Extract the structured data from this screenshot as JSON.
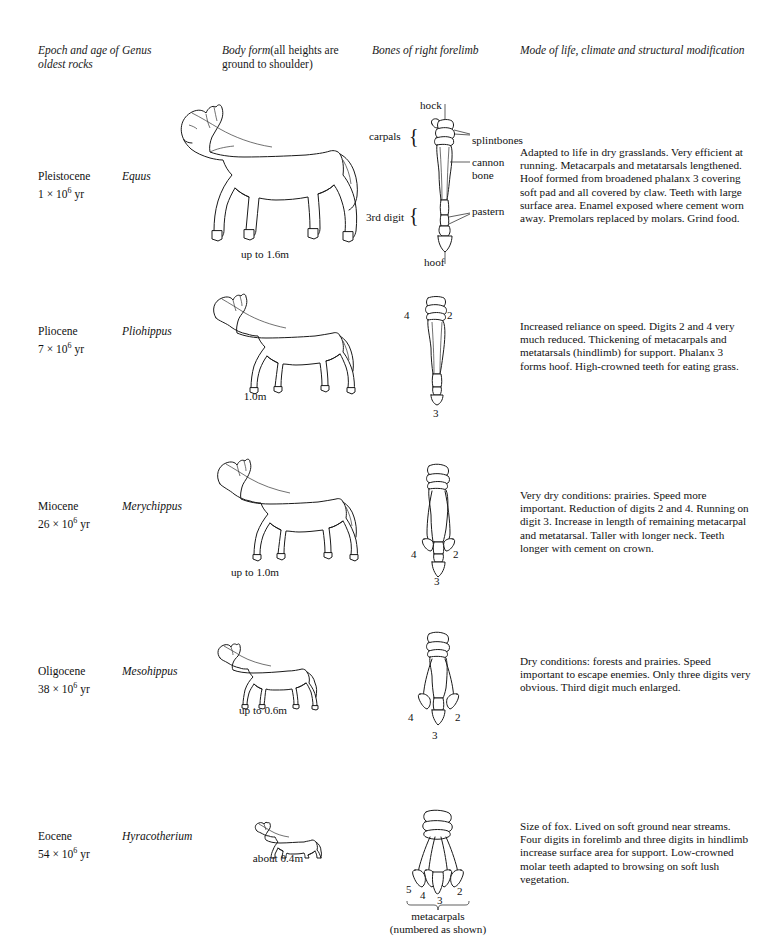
{
  "headers": {
    "epoch": "Epoch and age of oldest rocks",
    "genus": "Genus",
    "body_form_italic": "Body form",
    "body_form_rest": "(all heights are ground to shoulder)",
    "bones": "Bones of right forelimb",
    "mode": "Mode of life, climate and structural modification"
  },
  "rows": [
    {
      "epoch": "Pleistocene",
      "age_value": "1 × 10",
      "age_exp": "6",
      "age_unit": " yr",
      "genus": "Equus",
      "size_caption": "up to 1.6m",
      "description": "Adapted to life in dry grasslands. Very efficient at running. Metacarpals and metatarsals lengthened. Hoof formed from broadened phalanx 3 covering soft pad and all covered by claw. Teeth with large surface area. Enamel exposed where cement worn away. Premolars replaced by molars. Grind food.",
      "limb_labels": {
        "hock": "hock",
        "carpals": "carpals",
        "splintbones": "splintbones",
        "cannon_bone": "cannon bone",
        "third_digit": "3rd digit",
        "pastern": "pastern",
        "hoof": "hoof"
      }
    },
    {
      "epoch": "Pliocene",
      "age_value": "7 × 10",
      "age_exp": "6",
      "age_unit": " yr",
      "genus": "Pliohippus",
      "size_caption": "1.0m",
      "description": "Increased reliance on speed. Digits 2 and 4 very much reduced. Thickening of metacarpals and metatarsals (hindlimb) for support. Phalanx 3 forms hoof. High-crowned teeth for eating grass.",
      "digits": {
        "left": "4",
        "right": "2",
        "bottom": "3"
      }
    },
    {
      "epoch": "Miocene",
      "age_value": "26 × 10",
      "age_exp": "6",
      "age_unit": " yr",
      "genus": "Merychippus",
      "size_caption": "up to 1.0m",
      "description": "Very dry conditions: prairies. Speed more important. Reduction of digits 2 and 4. Running on digit 3. Increase in length of remaining metacarpal and metatarsal. Taller with longer neck. Teeth longer with cement on crown.",
      "digits": {
        "left": "4",
        "right": "2",
        "bottom": "3"
      }
    },
    {
      "epoch": "Oligocene",
      "age_value": "38 × 10",
      "age_exp": "6",
      "age_unit": " yr",
      "genus": "Mesohippus",
      "size_caption": "up to 0.6m",
      "description": "Dry conditions: forests and prairies. Speed important to escape enemies. Only three digits very obvious. Third digit much enlarged.",
      "digits": {
        "left": "4",
        "right": "2",
        "bottom": "3"
      }
    },
    {
      "epoch": "Eocene",
      "age_value": "54 × 10",
      "age_exp": "6",
      "age_unit": " yr",
      "genus": "Hyracotherium",
      "size_caption": "about 0.4m",
      "description": "Size of fox. Lived on soft ground near streams. Four digits in forelimb and three digits in hindlimb increase surface area for support. Low-crowned molar teeth adapted to browsing on soft lush vegetation.",
      "digits": {
        "d5": "5",
        "d4": "4",
        "d3": "3",
        "d2": "2"
      },
      "metacarpal_caption_line1": "metacarpals",
      "metacarpal_caption_line2": "(numbered as shown)"
    }
  ]
}
